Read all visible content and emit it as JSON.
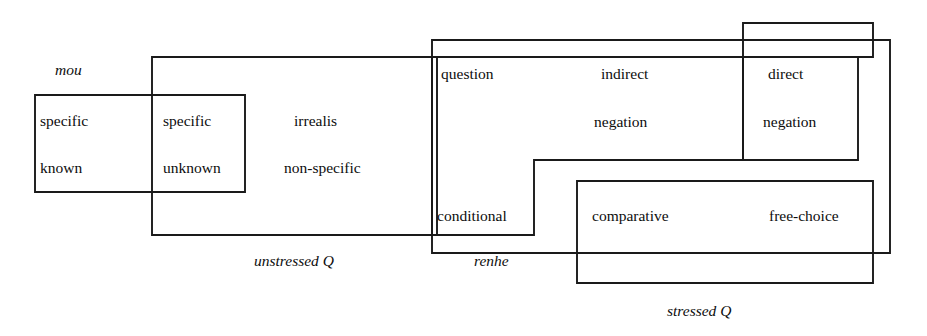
{
  "figure": {
    "type": "semantic-map",
    "title": "",
    "background_color": "#ffffff",
    "line_color": "#1a1a1a",
    "text_color": "#0d0d0d",
    "width": 927,
    "height": 336
  },
  "nodes": [
    {
      "id": "specific-known",
      "lines": [
        "specific",
        "known"
      ],
      "x": 40,
      "y": 113
    },
    {
      "id": "specific-unknown",
      "lines": [
        "specific",
        "unknown"
      ],
      "x": 163,
      "y": 113
    },
    {
      "id": "irrealis",
      "lines": [
        "irrealis",
        "non-specific"
      ],
      "x": 294,
      "y": 113
    },
    {
      "id": "question",
      "lines": [
        "question"
      ],
      "x": 441,
      "y": 66
    },
    {
      "id": "indirect-negation",
      "lines": [
        "indirect",
        "negation"
      ],
      "x": 601,
      "y": 66
    },
    {
      "id": "direct-negation",
      "lines": [
        "direct",
        "negation"
      ],
      "x": 768,
      "y": 66
    },
    {
      "id": "conditional",
      "lines": [
        "conditional"
      ],
      "x": 437,
      "y": 208
    },
    {
      "id": "comparative",
      "lines": [
        "comparative"
      ],
      "x": 592,
      "y": 208
    },
    {
      "id": "free-choice",
      "lines": [
        "free-choice"
      ],
      "x": 769,
      "y": 208
    }
  ],
  "node_text": {
    "specific": "specific",
    "known": "known",
    "specific2": "specific",
    "unknown": "unknown",
    "irrealis": "irrealis",
    "non_specific": "non-specific",
    "question": "question",
    "indirect": "indirect",
    "negation": "negation",
    "direct": "direct",
    "negation2": "negation",
    "conditional": "conditional",
    "comparative": "comparative",
    "free_choice": "free-choice"
  },
  "region_labels": {
    "mou": "mou",
    "unstressed_q": "unstressed Q",
    "renhe": "renhe",
    "stressed_q": "stressed Q"
  },
  "regions": [
    {
      "id": "mou",
      "label": "mou",
      "label_pos": {
        "x": 55,
        "y": 62
      },
      "covers": [
        "specific-known",
        "specific-unknown"
      ],
      "shape": "rect",
      "rect": {
        "x": 35,
        "y": 95,
        "w": 210,
        "h": 97
      }
    },
    {
      "id": "unstressed-q",
      "label": "unstressed Q",
      "label_pos": {
        "x": 254,
        "y": 253
      },
      "covers": [
        "specific-unknown",
        "irrealis"
      ],
      "shape": "rect",
      "rect": {
        "x": 152,
        "y": 57,
        "w": 285,
        "h": 178
      }
    },
    {
      "id": "renhe",
      "label": "renhe",
      "label_pos": {
        "x": 474,
        "y": 253
      },
      "covers": [
        "question",
        "indirect-negation",
        "direct-negation",
        "conditional",
        "comparative",
        "free-choice"
      ],
      "shape": "rect",
      "rect": {
        "x": 432,
        "y": 40,
        "w": 458,
        "h": 213
      }
    },
    {
      "id": "stressed-q",
      "label": "stressed Q",
      "label_pos": {
        "x": 667,
        "y": 303
      },
      "covers": [
        "comparative",
        "free-choice"
      ],
      "shape": "rect",
      "rect": {
        "x": 577,
        "y": 181,
        "w": 296,
        "h": 102
      }
    },
    {
      "id": "negative-polarity",
      "label": "",
      "covers": [
        "question",
        "indirect-negation",
        "direct-negation",
        "conditional"
      ],
      "shape": "L-path",
      "path": "M 432 57 L 875 57 L 875 23 L 743 23 L 743 160 L 534 160 L 534 235 L 432 235 Z"
    },
    {
      "id": "direct-negation-box",
      "label": "",
      "covers": [
        "direct-negation"
      ],
      "shape": "rect",
      "rect": {
        "x": 743,
        "y": 57,
        "w": 115,
        "h": 103
      }
    }
  ],
  "outlines": [
    {
      "id": "mou-outline",
      "d": "M 35 95 L 245 95 L 245 192 L 35 192 Z"
    },
    {
      "id": "unstressed-q-outline",
      "d": "M 152 57 L 437 57 L 437 235 L 152 235 Z"
    },
    {
      "id": "renhe-outline",
      "d": "M 432 40 L 890 40 L 890 253 L 432 253 Z"
    },
    {
      "id": "stressed-q-outline",
      "d": "M 577 181 L 873 181 L 873 283 L 577 283 Z"
    },
    {
      "id": "indirect-scope-outline",
      "d": "M 432 57 L 873 57 L 873 23 L 743 23"
    },
    {
      "id": "direct-negation-outline",
      "d": "M 743 23 L 743 160 L 534 160 L 534 235 L 432 235"
    },
    {
      "id": "inner-direct-box",
      "d": "M 743 57 L 858 57 L 858 160 L 743 160 Z"
    }
  ]
}
